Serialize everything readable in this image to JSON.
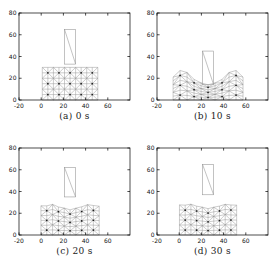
{
  "figure": {
    "background": "#ffffff",
    "axis_color": "#000000",
    "mesh_line_color": "#8c8c8c",
    "mesh_node_color": "#1f1f1f",
    "indenter_color": "#9a9a9a",
    "description_names": [
      "subplot-a",
      "subplot-b",
      "subplot-c",
      "subplot-d"
    ]
  },
  "mesh": {
    "x_min": 0,
    "x_max": 50,
    "y_min": 0,
    "y_max": 30,
    "cell_size": 10,
    "sub_size": 5,
    "pattern": "union-jack-crossed-triangles-with-center-nodes"
  },
  "chart_data": [
    {
      "type": "scatter",
      "caption": "(a) 0 s",
      "xlim": [
        -20,
        80
      ],
      "ylim": [
        0,
        80
      ],
      "xticks": [
        -20,
        0,
        20,
        40,
        60
      ],
      "yticks": [
        0,
        20,
        40,
        60,
        80
      ],
      "indenter": {
        "x0": 21,
        "x1": 31,
        "y0": 33,
        "y1": 65
      },
      "deform": {
        "cx": 26,
        "spread": 1.0,
        "h0": 30,
        "depth": 0,
        "w1": 10,
        "bulge": 0,
        "w2": 20,
        "w3": 8,
        "wave": 0
      }
    },
    {
      "type": "scatter",
      "caption": "(b) 10 s",
      "xlim": [
        -20,
        80
      ],
      "ylim": [
        0,
        80
      ],
      "xticks": [
        -20,
        0,
        20,
        40,
        60
      ],
      "yticks": [
        0,
        20,
        40,
        60,
        80
      ],
      "indenter": {
        "x0": 21,
        "x1": 31,
        "y0": 14,
        "y1": 45
      },
      "deform": {
        "cx": 26,
        "spread": 1.26,
        "h0": 19,
        "depth": 5,
        "w1": 10,
        "bulge": 9,
        "w2": 23,
        "w3": 7,
        "wave": 0
      }
    },
    {
      "type": "scatter",
      "caption": "(c) 20 s",
      "xlim": [
        -20,
        80
      ],
      "ylim": [
        0,
        80
      ],
      "xticks": [
        -20,
        0,
        20,
        40,
        60
      ],
      "yticks": [
        0,
        20,
        40,
        60,
        80
      ],
      "indenter": {
        "x0": 21,
        "x1": 31,
        "y0": 35,
        "y1": 62
      },
      "deform": {
        "cx": 26,
        "spread": 1.05,
        "h0": 26,
        "depth": 2.5,
        "w1": 11,
        "bulge": 2,
        "w2": 16,
        "w3": 8,
        "wave": 0.5
      }
    },
    {
      "type": "scatter",
      "caption": "(d) 30 s",
      "xlim": [
        -20,
        80
      ],
      "ylim": [
        0,
        80
      ],
      "xticks": [
        -20,
        0,
        20,
        40,
        60
      ],
      "yticks": [
        0,
        20,
        40,
        60,
        80
      ],
      "indenter": {
        "x0": 21,
        "x1": 31,
        "y0": 37,
        "y1": 65
      },
      "deform": {
        "cx": 26,
        "spread": 1.03,
        "h0": 27,
        "depth": 2.5,
        "w1": 10,
        "bulge": 1.2,
        "w2": 16,
        "w3": 8,
        "wave": 0.4
      }
    }
  ]
}
